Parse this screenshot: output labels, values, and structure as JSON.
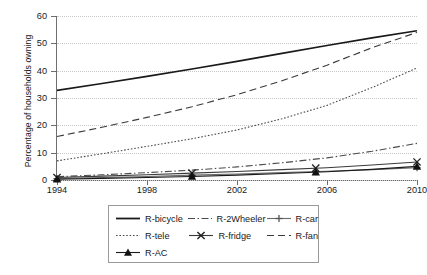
{
  "chart_data": {
    "type": "line",
    "title": "",
    "xlabel": "",
    "ylabel": "Percentage of households owning",
    "xlim": [
      1994,
      2010
    ],
    "ylim": [
      0,
      60
    ],
    "grid": true,
    "legend_position": "bottom",
    "x_ticks": [
      "1994",
      "1998",
      "2002",
      "2006",
      "2010"
    ],
    "x_tick_values": [
      1994,
      1998,
      2002,
      2006,
      2010
    ],
    "y_ticks": [
      "0",
      "10",
      "20",
      "30",
      "40",
      "50",
      "60"
    ],
    "y_tick_values": [
      0,
      10,
      20,
      30,
      40,
      50,
      60
    ],
    "x": [
      1994,
      1996,
      1998,
      2000,
      2002,
      2004,
      2006,
      2008,
      2010
    ],
    "series": [
      {
        "name": "R-bicycle",
        "style": "solid",
        "marker": "none",
        "color": "#1a1a1a",
        "values": [
          32.8,
          35.3,
          37.9,
          40.6,
          43.4,
          46.3,
          49.2,
          52.0,
          54.6
        ]
      },
      {
        "name": "R-2Wheeler",
        "style": "dash-dot",
        "marker": "none",
        "color": "#4a4a4a",
        "values": [
          1.2,
          1.9,
          2.7,
          3.6,
          4.8,
          6.3,
          8.1,
          10.5,
          13.4
        ]
      },
      {
        "name": "R-car",
        "style": "solid-plus",
        "marker": "plus",
        "color": "#6a6a6a",
        "values": [
          0.5,
          0.9,
          1.3,
          1.8,
          2.2,
          2.7,
          3.2,
          3.8,
          4.5
        ]
      },
      {
        "name": "R-tele",
        "style": "dotted",
        "marker": "none",
        "color": "#4a4a4a",
        "values": [
          7.0,
          9.6,
          12.3,
          15.1,
          18.3,
          22.4,
          27.3,
          33.8,
          41.0
        ]
      },
      {
        "name": "R-fridge",
        "style": "solid-x",
        "marker": "x",
        "color": "#3a3a3a",
        "values": [
          0.9,
          1.4,
          1.9,
          2.5,
          3.1,
          3.8,
          4.5,
          5.5,
          6.6
        ]
      },
      {
        "name": "R-fan",
        "style": "dashed",
        "marker": "none",
        "color": "#3a3a3a",
        "values": [
          15.9,
          19.3,
          22.9,
          26.8,
          31.2,
          36.3,
          42.0,
          48.4,
          54.0
        ]
      },
      {
        "name": "R-AC",
        "style": "solid-triangle",
        "marker": "triangle",
        "color": "#1a1a1a",
        "values": [
          0.3,
          0.6,
          0.9,
          1.3,
          1.8,
          2.4,
          3.0,
          3.9,
          5.0
        ]
      }
    ],
    "marker_x": [
      1994,
      2000,
      2005.5,
      2010
    ]
  },
  "legend": {
    "rows": [
      [
        "R-bicycle",
        "R-2Wheeler",
        "R-car"
      ],
      [
        "R-tele",
        "R-fridge",
        "R-fan"
      ],
      [
        "R-AC"
      ]
    ]
  }
}
